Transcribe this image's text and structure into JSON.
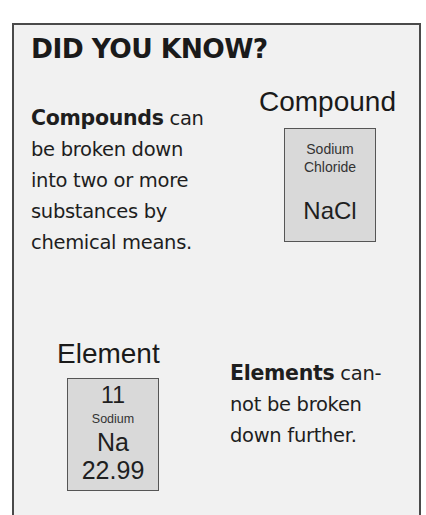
{
  "panel": {
    "title": "DID YOU KNOW?",
    "colors": {
      "background": "#f1f1f1",
      "border": "#4a4a4a",
      "box_fill": "#d9d9d9"
    }
  },
  "compound": {
    "label": "Compound",
    "text": {
      "bold": "Compounds",
      "lines": [
        "can",
        "be broken down",
        "into two or more",
        "substances by",
        "chemical means."
      ]
    },
    "box": {
      "name_line1": "Sodium",
      "name_line2": "Chloride",
      "formula": "NaCl"
    }
  },
  "element": {
    "label": "Element",
    "text": {
      "bold": "Elements",
      "lines": [
        "can-",
        "not be broken",
        "down further."
      ]
    },
    "box": {
      "atomic_number": "11",
      "name": "Sodium",
      "symbol": "Na",
      "atomic_mass": "22.99"
    }
  }
}
